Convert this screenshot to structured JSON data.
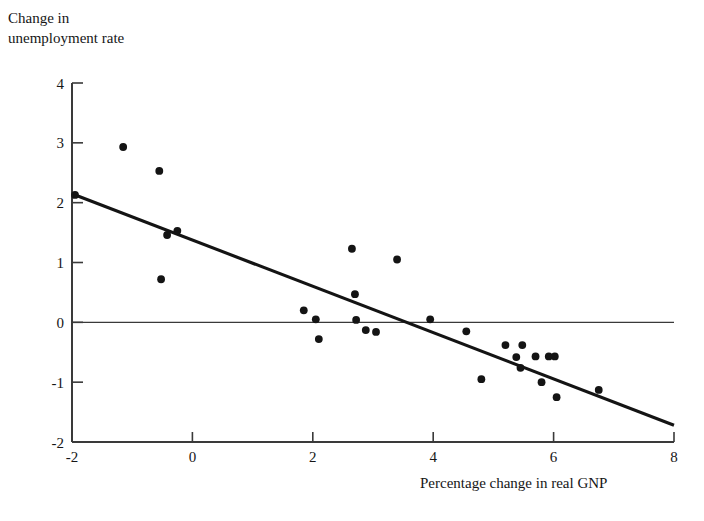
{
  "figure": {
    "y_axis_title_line1": "Change in",
    "y_axis_title_line2": "unemployment rate",
    "x_axis_title": "Percentage change in real GNP"
  },
  "chart_data": {
    "type": "scatter",
    "title": "",
    "xlabel": "Percentage change in real GNP",
    "ylabel": "Change in unemployment rate",
    "xlim": [
      -2,
      8
    ],
    "ylim": [
      -2,
      4
    ],
    "xticks": [
      -2,
      0,
      2,
      4,
      6,
      8
    ],
    "yticks": [
      -2,
      -1,
      0,
      1,
      2,
      3,
      4
    ],
    "xticklabels": [
      "-2",
      "0",
      "2",
      "4",
      "6",
      "8"
    ],
    "yticklabels": [
      "-2",
      "-1",
      "0",
      "1",
      "2",
      "3",
      "4"
    ],
    "grid": false,
    "legend": null,
    "marker_color": "#141414",
    "line_color": "#141414",
    "axis_color": "#3a3a3a",
    "zero_line": {
      "y": 0,
      "x_start": -2,
      "x_end": 8
    },
    "fit_line": {
      "x_start": -2,
      "y_start": 2.15,
      "x_end": 8,
      "y_end": -1.72,
      "slope": -0.387,
      "intercept": 1.376
    },
    "points": [
      {
        "x": -1.95,
        "y": 2.13
      },
      {
        "x": -1.15,
        "y": 2.93
      },
      {
        "x": -0.55,
        "y": 2.53
      },
      {
        "x": -0.52,
        "y": 0.72
      },
      {
        "x": -0.42,
        "y": 1.46
      },
      {
        "x": -0.25,
        "y": 1.53
      },
      {
        "x": 1.85,
        "y": 0.2
      },
      {
        "x": 2.05,
        "y": 0.05
      },
      {
        "x": 2.1,
        "y": -0.28
      },
      {
        "x": 2.65,
        "y": 1.23
      },
      {
        "x": 2.7,
        "y": 0.47
      },
      {
        "x": 2.72,
        "y": 0.04
      },
      {
        "x": 2.88,
        "y": -0.13
      },
      {
        "x": 3.05,
        "y": -0.16
      },
      {
        "x": 3.4,
        "y": 1.05
      },
      {
        "x": 3.95,
        "y": 0.05
      },
      {
        "x": 4.55,
        "y": -0.15
      },
      {
        "x": 4.8,
        "y": -0.95
      },
      {
        "x": 5.2,
        "y": -0.38
      },
      {
        "x": 5.38,
        "y": -0.58
      },
      {
        "x": 5.45,
        "y": -0.76
      },
      {
        "x": 5.48,
        "y": -0.38
      },
      {
        "x": 5.7,
        "y": -0.57
      },
      {
        "x": 5.8,
        "y": -1.0
      },
      {
        "x": 5.92,
        "y": -0.57
      },
      {
        "x": 6.02,
        "y": -0.57
      },
      {
        "x": 6.05,
        "y": -1.25
      },
      {
        "x": 6.75,
        "y": -1.13
      }
    ]
  }
}
